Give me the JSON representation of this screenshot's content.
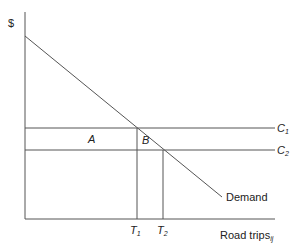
{
  "diagram": {
    "type": "economics supply-demand diagram",
    "y_axis_label": "$",
    "x_axis_label": "Road trips",
    "x_axis_label_subscript": "ij",
    "curves": [
      {
        "name": "Demand",
        "label": "Demand",
        "kind": "downward-sloping line"
      },
      {
        "name": "C1",
        "label": "C",
        "subscript": "1",
        "kind": "horizontal cost line (higher)"
      },
      {
        "name": "C2",
        "label": "C",
        "subscript": "2",
        "kind": "horizontal cost line (lower)"
      }
    ],
    "regions": [
      {
        "label": "A",
        "description": "rectangle between C1 and C2 from axis to T1"
      },
      {
        "label": "B",
        "description": "triangle between C1, C2 and Demand from T1 to T2"
      }
    ],
    "ticks": [
      {
        "label": "T",
        "subscript": "1"
      },
      {
        "label": "T",
        "subscript": "2"
      }
    ]
  },
  "labels": {
    "dollar": "$",
    "c1": "C",
    "c1_sub": "1",
    "c2": "C",
    "c2_sub": "2",
    "a": "A",
    "b": "B",
    "demand": "Demand",
    "t1": "T",
    "t1_sub": "1",
    "t2": "T",
    "t2_sub": "2",
    "xaxis": "Road trips",
    "xaxis_sub": "ij"
  },
  "colors": {
    "line": "#555555",
    "text": "#222222"
  }
}
